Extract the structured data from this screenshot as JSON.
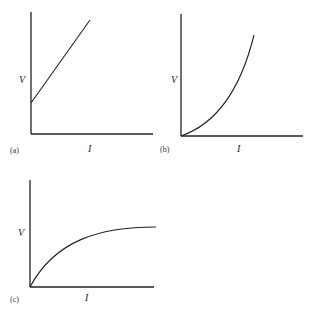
{
  "panels": [
    {
      "id": "a",
      "caption": "(a)",
      "ylabel": "V",
      "xlabel": "I",
      "shape": "linear-with-positive-intercept"
    },
    {
      "id": "b",
      "caption": "(b)",
      "ylabel": "V",
      "xlabel": "I",
      "shape": "convex-increasing-from-origin"
    },
    {
      "id": "c",
      "caption": "(c)",
      "ylabel": "V",
      "xlabel": "I",
      "shape": "concave-saturating-from-origin"
    }
  ]
}
